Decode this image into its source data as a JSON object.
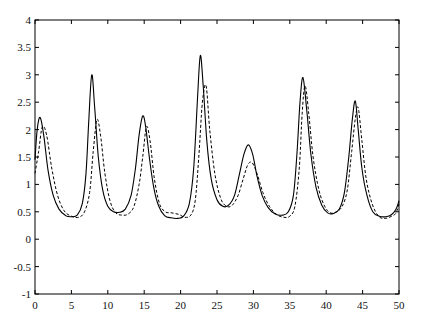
{
  "chart_data": {
    "type": "line",
    "title": "",
    "xlabel": "",
    "ylabel": "",
    "xlim": [
      0,
      50
    ],
    "ylim": [
      -1,
      4
    ],
    "grid": false,
    "legend": null,
    "x_ticks": [
      0,
      5,
      10,
      15,
      20,
      25,
      30,
      35,
      40,
      45,
      50
    ],
    "y_ticks": [
      -1,
      -0.5,
      0,
      0.5,
      1,
      1.5,
      2,
      2.5,
      3,
      3.5,
      4
    ],
    "x_tick_labels": [
      "0",
      "5",
      "10",
      "15",
      "20",
      "25",
      "30",
      "35",
      "40",
      "45",
      "50"
    ],
    "y_tick_labels": [
      "-1",
      "-0.5",
      "0",
      "0.5",
      "1",
      "1.5",
      "2",
      "2.5",
      "3",
      "3.5",
      "4"
    ],
    "series": [
      {
        "name": "solid",
        "style": "solid",
        "color": "#000000",
        "x": [
          0,
          0.3,
          0.7,
          1.2,
          1.8,
          2.5,
          3.3,
          4.2,
          5,
          5.8,
          6.5,
          7,
          7.4,
          7.8,
          8.2,
          8.7,
          9.3,
          10,
          10.8,
          11.6,
          12.4,
          13.2,
          13.8,
          14.3,
          14.8,
          15.2,
          15.7,
          16.3,
          17,
          17.8,
          18.7,
          19.6,
          20.4,
          21.2,
          21.8,
          22.3,
          22.7,
          23.1,
          23.6,
          24.2,
          25,
          25.8,
          26.6,
          27.4,
          28.1,
          28.7,
          29.3,
          29.9,
          30.5,
          31.2,
          32,
          33,
          34,
          34.8,
          35.5,
          36,
          36.4,
          36.8,
          37.3,
          37.9,
          38.6,
          39.4,
          40.2,
          41,
          41.8,
          42.5,
          43.1,
          43.6,
          44,
          44.4,
          44.9,
          45.6,
          46.4,
          47.3,
          48.2,
          49,
          49.6,
          50
        ],
        "y": [
          1.45,
          2.0,
          2.22,
          1.9,
          1.25,
          0.8,
          0.55,
          0.43,
          0.41,
          0.44,
          0.65,
          1.2,
          2.2,
          3.0,
          2.4,
          1.5,
          0.9,
          0.6,
          0.5,
          0.49,
          0.55,
          0.8,
          1.3,
          1.9,
          2.25,
          2.05,
          1.5,
          0.95,
          0.6,
          0.43,
          0.39,
          0.38,
          0.42,
          0.65,
          1.3,
          2.5,
          3.35,
          2.8,
          1.8,
          1.1,
          0.72,
          0.6,
          0.62,
          0.8,
          1.2,
          1.55,
          1.72,
          1.55,
          1.15,
          0.8,
          0.58,
          0.46,
          0.44,
          0.5,
          0.8,
          1.6,
          2.5,
          2.95,
          2.4,
          1.55,
          0.95,
          0.62,
          0.48,
          0.47,
          0.55,
          0.85,
          1.5,
          2.2,
          2.52,
          2.0,
          1.3,
          0.8,
          0.5,
          0.42,
          0.41,
          0.45,
          0.55,
          0.7
        ]
      },
      {
        "name": "dashed",
        "style": "dashed",
        "color": "#000000",
        "x": [
          0,
          0.5,
          1.0,
          1.6,
          2.3,
          3.1,
          4,
          5,
          6,
          6.8,
          7.5,
          8,
          8.5,
          9,
          9.6,
          10.3,
          11.1,
          12,
          12.8,
          13.6,
          14.3,
          14.8,
          15.3,
          15.8,
          16.4,
          17.1,
          17.9,
          18.8,
          19.8,
          20.6,
          21.4,
          22,
          22.5,
          23,
          23.5,
          24,
          24.7,
          25.5,
          26.3,
          27.1,
          27.9,
          28.6,
          29.2,
          29.8,
          30.5,
          31.3,
          32.2,
          33.2,
          34.2,
          35,
          35.7,
          36.3,
          36.7,
          37.1,
          37.6,
          38.2,
          39,
          39.8,
          40.6,
          41.4,
          42.2,
          42.9,
          43.5,
          44,
          44.4,
          44.9,
          45.5,
          46.3,
          47.2,
          48.1,
          49,
          49.6,
          50
        ],
        "y": [
          1.2,
          1.6,
          2.05,
          1.9,
          1.3,
          0.8,
          0.52,
          0.42,
          0.4,
          0.5,
          0.85,
          1.6,
          2.18,
          1.9,
          1.2,
          0.7,
          0.48,
          0.44,
          0.46,
          0.6,
          1.0,
          1.5,
          2.05,
          1.8,
          1.1,
          0.65,
          0.5,
          0.48,
          0.45,
          0.4,
          0.44,
          0.7,
          1.5,
          2.5,
          2.8,
          2.0,
          1.2,
          0.75,
          0.6,
          0.62,
          0.8,
          1.1,
          1.35,
          1.4,
          1.2,
          0.85,
          0.6,
          0.45,
          0.4,
          0.42,
          0.6,
          1.3,
          2.3,
          2.8,
          2.3,
          1.5,
          0.9,
          0.6,
          0.48,
          0.5,
          0.6,
          0.9,
          1.6,
          2.2,
          2.4,
          1.8,
          1.1,
          0.65,
          0.42,
          0.38,
          0.42,
          0.48,
          0.65
        ]
      }
    ]
  },
  "plot": {
    "left": 35,
    "right": 399,
    "top": 20,
    "bottom": 294
  }
}
